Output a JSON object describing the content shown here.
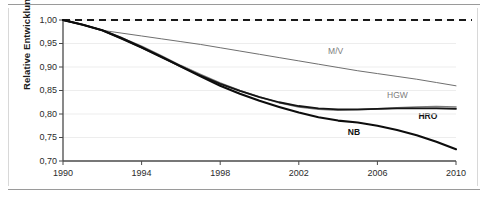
{
  "figure": {
    "background_color": "#ffffff",
    "frame_rule_color": "#9a9a9a"
  },
  "chart_data": {
    "type": "line",
    "title": "",
    "subtitle": "",
    "xlabel": "",
    "ylabel": "Relative Entwicklung",
    "xlim": [
      1990,
      2010
    ],
    "ylim": [
      0.7,
      1.0
    ],
    "grid": true,
    "grid_axis": "y",
    "legend": "inline-annotations",
    "x_tick_labels": [
      "1990",
      "1994",
      "1998",
      "2002",
      "2006",
      "2010"
    ],
    "x_ticks": [
      1990,
      1994,
      1998,
      2002,
      2006,
      2010
    ],
    "y_tick_labels": [
      "0,70",
      "0,75",
      "0,80",
      "0,85",
      "0,90",
      "0,95",
      "1,00"
    ],
    "y_ticks": [
      0.7,
      0.75,
      0.8,
      0.85,
      0.9,
      0.95,
      1.0
    ],
    "decimal_separator": ",",
    "x": [
      1990,
      1991,
      1992,
      1993,
      1994,
      1995,
      1996,
      1997,
      1998,
      1999,
      2000,
      2001,
      2002,
      2003,
      2004,
      2005,
      2006,
      2007,
      2008,
      2009,
      2010
    ],
    "reference_line": {
      "name": "baseline-1990",
      "value": 1.0,
      "style": "dashed",
      "color": "#1a1a1a"
    },
    "series": [
      {
        "name": "M/V",
        "label": "M/V",
        "color": "#6f6f6f",
        "width": 1.0,
        "style": "solid",
        "label_x": 2004.0,
        "label_y": 0.935,
        "values": [
          1.0,
          0.99,
          0.978,
          0.972,
          0.966,
          0.96,
          0.954,
          0.948,
          0.941,
          0.934,
          0.927,
          0.92,
          0.913,
          0.906,
          0.899,
          0.892,
          0.886,
          0.88,
          0.874,
          0.867,
          0.86
        ]
      },
      {
        "name": "HGW",
        "label": "HGW",
        "color": "#7a7a7a",
        "width": 1.6,
        "style": "solid",
        "label_x": 2007.0,
        "label_y": 0.84,
        "values": [
          1.0,
          0.99,
          0.978,
          0.962,
          0.944,
          0.924,
          0.903,
          0.884,
          0.866,
          0.85,
          0.836,
          0.824,
          0.815,
          0.81,
          0.808,
          0.809,
          0.811,
          0.813,
          0.815,
          0.816,
          0.815
        ]
      },
      {
        "name": "HRO",
        "label": "HRO",
        "color": "#151515",
        "width": 1.8,
        "style": "solid",
        "label_x": 2008.6,
        "label_y": 0.795,
        "values": [
          1.0,
          0.99,
          0.978,
          0.96,
          0.941,
          0.921,
          0.901,
          0.882,
          0.864,
          0.849,
          0.836,
          0.825,
          0.817,
          0.812,
          0.81,
          0.81,
          0.811,
          0.812,
          0.812,
          0.812,
          0.811
        ]
      },
      {
        "name": "NB",
        "label": "NB",
        "color": "#0d0d0d",
        "width": 2.1,
        "style": "solid",
        "label_x": 2005.0,
        "label_y": 0.762,
        "values": [
          1.0,
          0.99,
          0.978,
          0.961,
          0.942,
          0.922,
          0.901,
          0.88,
          0.86,
          0.843,
          0.828,
          0.815,
          0.803,
          0.793,
          0.786,
          0.782,
          0.775,
          0.766,
          0.755,
          0.741,
          0.725
        ]
      }
    ]
  }
}
